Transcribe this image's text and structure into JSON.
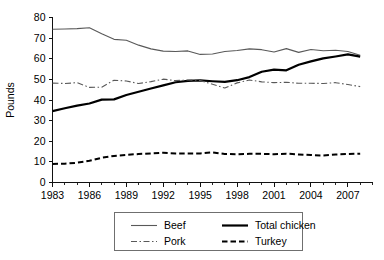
{
  "chart_data": {
    "type": "line",
    "title": "",
    "xlabel": "",
    "ylabel": "Pounds",
    "xlim": [
      1983,
      2009
    ],
    "ylim": [
      0,
      80
    ],
    "grid": false,
    "legend_position": "bottom",
    "y_ticks": [
      0,
      10,
      20,
      30,
      40,
      50,
      60,
      70,
      80
    ],
    "y_tick_labels": [
      "0",
      "10",
      "20",
      "30",
      "40",
      "50",
      "60",
      "70",
      "80"
    ],
    "x_ticks": [
      1983,
      1986,
      1989,
      1992,
      1995,
      1998,
      2001,
      2004,
      2007
    ],
    "x_tick_labels": [
      "1983",
      "1986",
      "1989",
      "1992",
      "1995",
      "1998",
      "2001",
      "2004",
      "2007"
    ],
    "x_minor_tick_step": 1,
    "x": [
      1983,
      1984,
      1985,
      1986,
      1987,
      1988,
      1989,
      1990,
      1991,
      1992,
      1993,
      1994,
      1995,
      1996,
      1997,
      1998,
      1999,
      2000,
      2001,
      2002,
      2003,
      2004,
      2005,
      2006,
      2007,
      2008
    ],
    "series": [
      {
        "name": "Beef",
        "style": "solid-thin",
        "color": "#595959",
        "width": 1.1,
        "values": [
          74.3,
          74.4,
          74.6,
          75.0,
          72.1,
          69.4,
          69.0,
          66.6,
          64.8,
          63.7,
          63.5,
          63.8,
          62.1,
          62.3,
          63.5,
          64.0,
          64.8,
          64.4,
          63.3,
          64.9,
          63.1,
          64.5,
          63.9,
          64.1,
          63.5,
          61.7
        ],
        "legend_label": "Beef"
      },
      {
        "name": "Total chicken",
        "style": "solid-thick",
        "color": "#000000",
        "width": 2.2,
        "values": [
          34.6,
          36.0,
          37.3,
          38.3,
          40.2,
          40.3,
          42.4,
          44.0,
          45.6,
          47.1,
          48.6,
          49.3,
          49.5,
          49.1,
          48.8,
          49.6,
          51.1,
          53.7,
          54.7,
          54.4,
          57.1,
          58.7,
          60.2,
          61.1,
          62.1,
          61.0
        ],
        "legend_label": "Total chicken"
      },
      {
        "name": "Pork",
        "style": "dashdot-thin",
        "color": "#595959",
        "width": 1.1,
        "values": [
          48.2,
          48.0,
          48.4,
          46.1,
          46.2,
          49.6,
          49.2,
          48.0,
          48.9,
          50.1,
          49.4,
          49.7,
          49.5,
          47.6,
          45.8,
          48.3,
          49.7,
          48.8,
          48.4,
          48.6,
          48.1,
          48.1,
          48.0,
          48.4,
          47.5,
          46.5
        ],
        "legend_label": "Pork"
      },
      {
        "name": "Turkey",
        "style": "dashed-thick",
        "color": "#000000",
        "width": 2.0,
        "values": [
          9.0,
          9.1,
          9.6,
          10.5,
          12.0,
          12.9,
          13.4,
          13.8,
          14.1,
          14.4,
          14.1,
          14.1,
          14.1,
          14.6,
          13.8,
          13.7,
          13.9,
          13.9,
          13.7,
          14.0,
          13.6,
          13.3,
          13.1,
          13.6,
          13.8,
          14.0
        ],
        "legend_label": "Turkey"
      }
    ]
  },
  "legend": {
    "items": [
      {
        "label": "Beef"
      },
      {
        "label": "Total chicken"
      },
      {
        "label": "Pork"
      },
      {
        "label": "Turkey"
      }
    ]
  },
  "axes": {
    "y_title": "Pounds"
  }
}
